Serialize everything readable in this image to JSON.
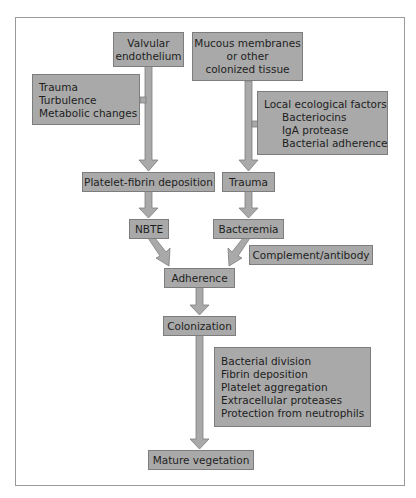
{
  "diagram": {
    "type": "flowchart",
    "colors": {
      "box_fill": "#a9a9a9",
      "box_border": "#7d7d7d",
      "arrow": "#a9a9a9",
      "frame": "#9a9a9a"
    },
    "nodes": {
      "valvular": {
        "lines": [
          "Valvular",
          "endothelium"
        ]
      },
      "mucous": {
        "lines": [
          "Mucous membranes",
          "or other",
          "colonized tissue"
        ]
      },
      "trauma_factors": {
        "lines": [
          "Trauma",
          "Turbulence",
          "Metabolic changes"
        ]
      },
      "local_factors": {
        "title": "Local ecological factors",
        "items": [
          "Bacteriocins",
          "IgA protease",
          "Bacterial adherence"
        ]
      },
      "platelet_fibrin": {
        "label": "Platelet-fibrin deposition"
      },
      "trauma": {
        "label": "Trauma"
      },
      "nbte": {
        "label": "NBTE"
      },
      "bacteremia": {
        "label": "Bacteremia"
      },
      "complement": {
        "label": "Complement/antibody"
      },
      "adherence": {
        "label": "Adherence"
      },
      "colonization": {
        "label": "Colonization"
      },
      "growth_factors": {
        "lines": [
          "Bacterial division",
          "Fibrin deposition",
          "Platelet aggregation",
          "Extracellular proteases",
          "Protection from neutrophils"
        ]
      },
      "mature": {
        "label": "Mature vegetation"
      }
    },
    "edges": [
      [
        "Valvular endothelium",
        "Platelet-fibrin deposition"
      ],
      [
        "Trauma/Turbulence/Metabolic changes",
        "Valvular endothelium path"
      ],
      [
        "Platelet-fibrin deposition",
        "NBTE"
      ],
      [
        "Mucous membranes or other colonized tissue",
        "Trauma"
      ],
      [
        "Local ecological factors",
        "Mucous membranes path"
      ],
      [
        "Trauma",
        "Bacteremia"
      ],
      [
        "NBTE",
        "Adherence"
      ],
      [
        "Bacteremia",
        "Adherence"
      ],
      [
        "Adherence",
        "Colonization"
      ],
      [
        "Colonization",
        "Mature vegetation"
      ]
    ]
  }
}
